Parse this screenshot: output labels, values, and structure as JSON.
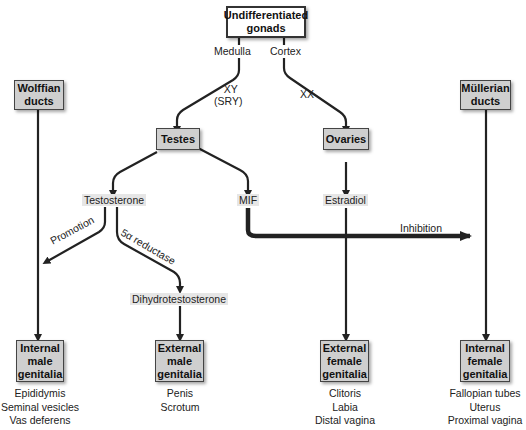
{
  "nodes": {
    "gonads": {
      "line1": "Undifferentiated",
      "line2": "gonads"
    },
    "wolffian": {
      "line1": "Wolffian",
      "line2": "ducts"
    },
    "mullerian": {
      "line1": "Müllerian",
      "line2": "ducts"
    },
    "testes": {
      "label": "Testes"
    },
    "ovaries": {
      "label": "Ovaries"
    },
    "internal_male": {
      "line1": "Internal",
      "line2": "male",
      "line3": "genitalia"
    },
    "external_male": {
      "line1": "External",
      "line2": "male",
      "line3": "genitalia"
    },
    "external_female": {
      "line1": "External",
      "line2": "female",
      "line3": "genitalia"
    },
    "internal_female": {
      "line1": "Internal",
      "line2": "female",
      "line3": "genitalia"
    }
  },
  "labels": {
    "medulla": "Medulla",
    "cortex": "Cortex",
    "xy": "XY",
    "sry": "(SRY)",
    "xx": "XX",
    "testosterone": "Testosterone",
    "mif": "MIF",
    "estradiol": "Estradiol",
    "inhibition": "Inhibition",
    "promotion": "Promotion",
    "reductase": "5α reductase",
    "dht": "Dihydrotestosterone"
  },
  "outcomes": {
    "internal_male": [
      "Epididymis",
      "Seminal vesicles",
      "Vas deferens"
    ],
    "external_male": [
      "Penis",
      "Scrotum"
    ],
    "external_female": [
      "Clitoris",
      "Labia",
      "Distal vagina"
    ],
    "internal_female": [
      "Fallopian tubes",
      "Uterus",
      "Proximal vagina"
    ]
  },
  "colors": {
    "box_fill": "#cfcfcf",
    "line": "#222222"
  }
}
